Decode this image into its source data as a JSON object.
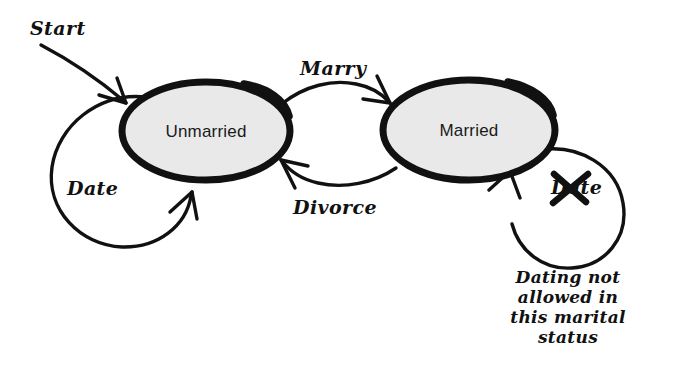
{
  "diagram": {
    "background_color": "#ffffff",
    "ink_color": "#111111",
    "state_fill_color": "#e9e9e9",
    "states": [
      {
        "id": "unmarried",
        "label": "Unmarried"
      },
      {
        "id": "married",
        "label": "Married"
      }
    ],
    "transitions": [
      {
        "id": "start",
        "label": "Start"
      },
      {
        "id": "marry",
        "label": "Marry"
      },
      {
        "id": "divorce",
        "label": "Divorce"
      },
      {
        "id": "date-unmarried",
        "label": "Date"
      },
      {
        "id": "date-married",
        "label": "Date",
        "struck_out": "true"
      }
    ],
    "annotation": {
      "line1": "Dating not",
      "line2": "allowed in",
      "line3": "this marital",
      "line4": "status"
    }
  }
}
